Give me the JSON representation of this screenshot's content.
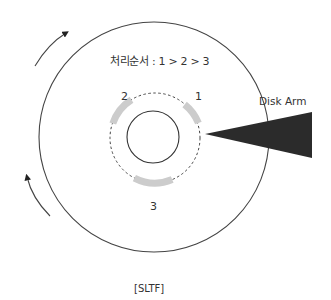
{
  "diagram": {
    "type": "disk-scheduling",
    "order_label": "처리순서 : 1 > 2 > 3",
    "requests": [
      {
        "id": "1",
        "label": "1"
      },
      {
        "id": "2",
        "label": "2"
      },
      {
        "id": "3",
        "label": "3"
      }
    ],
    "arm_label": "Disk Arm",
    "caption": "[SLTF]",
    "rotation": "clockwise",
    "colors": {
      "stroke": "#333333",
      "request_segment": "#cccccc",
      "disk_arm": "#2b2b2b"
    }
  }
}
